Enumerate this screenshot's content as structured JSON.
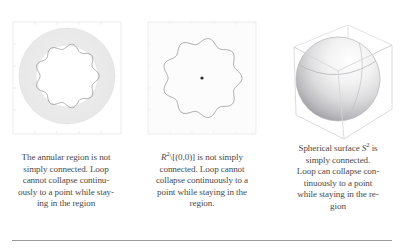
{
  "figure": {
    "panels": [
      {
        "name": "annulus-plot",
        "kind": "annular-region-with-loop",
        "frame_color": "#e8e8ec",
        "region_fill": "#ececec",
        "loop_color": "#8f8f96",
        "outer_radius_px": 48,
        "inner_radius_px": 31,
        "loop_radius_px": 36,
        "loop_wave_lobes": 9,
        "loop_wave_amplitude_px": 2.6
      },
      {
        "name": "punctured-plane-plot",
        "kind": "wavy-loop-with-puncture-point",
        "frame_color": "#e8e8ec",
        "region_fill": "#fbfbfb",
        "loop_color": "#8a8a92",
        "loop_radius_px": 43,
        "loop_wave_lobes": 9,
        "loop_wave_amplitude_px": 3.0,
        "puncture_dot_color": "#2b2b2b",
        "puncture_dot_radius_px": 1.6
      },
      {
        "name": "sphere-plot",
        "kind": "shaded-sphere-in-wireframe-box",
        "box_color": "#d8d8dc",
        "sphere_light_color": "#fcfcfc",
        "sphere_shadow_color": "#9a9a9e",
        "sphere_radius_px": 42,
        "seam_color": "#b4b4b8"
      }
    ],
    "captions": [
      {
        "id": "caption-annulus",
        "lines": [
          "The annular region is not",
          "simply connected. Loop",
          "cannot collapse continu-",
          "ously to a point while stay-",
          "ing in the region"
        ]
      },
      {
        "id": "caption-punctured-plane",
        "math_prefix": "R",
        "math_exponent": "2",
        "math_suffix": "\\[(0,0)]",
        "lines": [
          " is not simply",
          "connected. Loop cannot",
          "collapse continuously to a",
          "point while staying in the",
          "region."
        ]
      },
      {
        "id": "caption-sphere",
        "math_prefix": "Spherical surface ",
        "math_symbol": "S",
        "math_exponent": "2",
        "math_suffix": " is",
        "lines": [
          "simply connected.",
          "Loop can collapse con-",
          "tinuously to a point",
          "while staying in the re-",
          "gion"
        ]
      }
    ],
    "rule": {
      "color": "#9a9a9a"
    }
  }
}
